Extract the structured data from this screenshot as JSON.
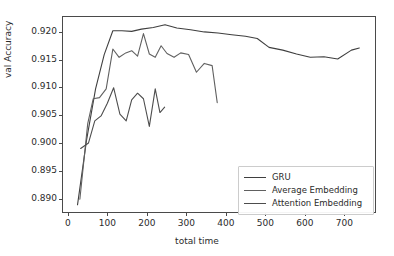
{
  "chart_data": {
    "type": "line",
    "title": "",
    "xlabel": "total time",
    "ylabel": "val Accuracy",
    "xlim": [
      -15,
      780
    ],
    "ylim": [
      0.8875,
      0.9228
    ],
    "xticks": [
      0,
      100,
      200,
      300,
      400,
      500,
      600,
      700
    ],
    "xtick_labels": [
      "0",
      "100",
      "200",
      "300",
      "400",
      "500",
      "600",
      "700"
    ],
    "yticks": [
      0.89,
      0.895,
      0.9,
      0.905,
      0.91,
      0.915,
      0.92
    ],
    "ytick_labels": [
      "0.890",
      "0.895",
      "0.900",
      "0.905",
      "0.910",
      "0.915",
      "0.920"
    ],
    "grid": false,
    "legend_position": "lower right",
    "series": [
      {
        "name": "GRU",
        "color": "#3f3f3f",
        "x": [
          22,
          45,
          68,
          90,
          112,
          135,
          160,
          185,
          215,
          245,
          275,
          310,
          345,
          380,
          415,
          450,
          480,
          510,
          545,
          580,
          615,
          650,
          685,
          720,
          740
        ],
        "y": [
          0.8888,
          0.9005,
          0.9098,
          0.916,
          0.9203,
          0.9203,
          0.9202,
          0.9206,
          0.9209,
          0.9214,
          0.9208,
          0.9205,
          0.9201,
          0.9199,
          0.9196,
          0.9193,
          0.9189,
          0.9173,
          0.9168,
          0.9161,
          0.9155,
          0.9156,
          0.9152,
          0.9168,
          0.9172
        ]
      },
      {
        "name": "Average Embedding",
        "color": "#606060",
        "x": [
          28,
          48,
          62,
          78,
          95,
          112,
          128,
          145,
          160,
          175,
          190,
          205,
          220,
          235,
          250,
          268,
          285,
          305,
          325,
          345,
          365,
          378
        ],
        "y": [
          0.8898,
          0.9035,
          0.908,
          0.9082,
          0.9098,
          0.917,
          0.9155,
          0.9163,
          0.9167,
          0.9157,
          0.9198,
          0.9161,
          0.9155,
          0.9176,
          0.9162,
          0.9155,
          0.9163,
          0.916,
          0.9128,
          0.9144,
          0.914,
          0.9073
        ]
      },
      {
        "name": "Attention Embedding",
        "color": "#4d4d4d",
        "x": [
          30,
          50,
          66,
          82,
          98,
          114,
          130,
          146,
          160,
          175,
          190,
          205,
          220,
          232,
          244
        ],
        "y": [
          0.899,
          0.9,
          0.904,
          0.9049,
          0.9072,
          0.91,
          0.9052,
          0.904,
          0.9078,
          0.909,
          0.908,
          0.903,
          0.9098,
          0.9055,
          0.9065
        ]
      }
    ]
  },
  "legend": {
    "items": [
      {
        "label": "GRU"
      },
      {
        "label": "Average Embedding"
      },
      {
        "label": "Attention Embedding"
      }
    ]
  }
}
